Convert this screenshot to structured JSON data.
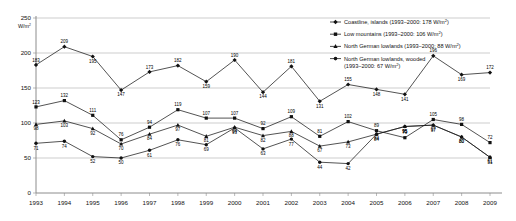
{
  "chart_data": {
    "type": "line",
    "title": "",
    "xlabel": "",
    "ylabel": "W/m²",
    "ylim": [
      0,
      250
    ],
    "yticks": [
      0,
      50,
      100,
      150,
      200,
      250
    ],
    "grid": true,
    "legend_position": "top-right",
    "categories": [
      1993,
      1994,
      1995,
      1996,
      1997,
      1998,
      1999,
      2000,
      2001,
      2002,
      2003,
      2004,
      2005,
      2006,
      2007,
      2008,
      2009
    ],
    "series": [
      {
        "name": "Coastline, islands",
        "reference_label": "1993–2000: 178 W/m²",
        "legend": "Coastline, islands (1993–2000: 178 W/m²)",
        "values": [
          183,
          209,
          195,
          147,
          173,
          182,
          159,
          190,
          144,
          181,
          131,
          155,
          148,
          141,
          196,
          169,
          172
        ]
      },
      {
        "name": "Low mountains",
        "reference_label": "1993–2000: 106 W/m²",
        "legend": "Low mountains (1993–2000: 106 W/m²)",
        "values": [
          123,
          132,
          111,
          76,
          94,
          119,
          107,
          107,
          92,
          109,
          81,
          102,
          89,
          79,
          105,
          98,
          72
        ]
      },
      {
        "name": "North German lowlands",
        "reference_label": "1993–2000: 88 W/m²",
        "legend": "North German lowlands (1993–2000: 88 W/m²)",
        "values": [
          98,
          103,
          92,
          70,
          84,
          97,
          81,
          94,
          82,
          88,
          67,
          73,
          84,
          95,
          97,
          80,
          51
        ]
      },
      {
        "name": "North German lowlands, wooded",
        "reference_label": "1993–2000: 67 W/m²",
        "legend": "North German lowlands, wooded (1993–2000: 67 W/m²)",
        "values": [
          71,
          74,
          52,
          50,
          61,
          76,
          69,
          93,
          63,
          77,
          44,
          42,
          84,
          95,
          97,
          80,
          51
        ]
      }
    ]
  },
  "axes": {
    "y_unit": "W/m",
    "y_unit_sup": "2",
    "y_tick_labels": [
      "250",
      "200",
      "150",
      "100",
      "50",
      "0"
    ],
    "x_tick_labels": [
      "1993",
      "1994",
      "1995",
      "1996",
      "1997",
      "1998",
      "1999",
      "2000",
      "2001",
      "2002",
      "2003",
      "2004",
      "2005",
      "2006",
      "2007",
      "2008",
      "2009"
    ]
  },
  "legend": {
    "items": [
      {
        "name_text": "Coastline, islands (1993–2000: 178 W/m",
        "sup": "2",
        "tail": ")",
        "line2": ""
      },
      {
        "name_text": "Low mountains (1993–2000: 106 W/m",
        "sup": "2",
        "tail": ")",
        "line2": ""
      },
      {
        "name_text": "North German lowlands (1993–2000: 88 W/m",
        "sup": "2",
        "tail": ")",
        "line2": ""
      },
      {
        "name_text": "North German lowlands, wooded",
        "sup": "2",
        "tail": ")",
        "line2": "(1993–2000: 67 W/m"
      }
    ]
  },
  "colors": {
    "line": "#1a1a1a",
    "grid": "#9a9a9a",
    "axis": "#8c8c8c",
    "background": "#ffffff"
  }
}
